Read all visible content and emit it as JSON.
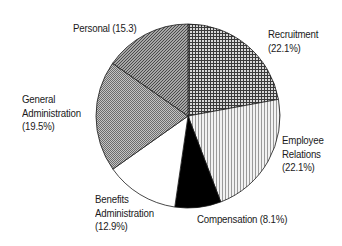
{
  "chart_data": {
    "type": "pie",
    "title": "",
    "start_angle_deg": 0,
    "direction": "clockwise",
    "legend": "none (direct labels)",
    "slices": [
      {
        "name": "Recruitment",
        "value": 22.1,
        "label_lines": [
          "Recruitment",
          "(22.1%)"
        ],
        "pattern": "crosshatch-dark"
      },
      {
        "name": "Employee Relations",
        "value": 22.1,
        "label_lines": [
          "Employee",
          "Relations",
          "(22.1%)"
        ],
        "pattern": "vertical-lines-light"
      },
      {
        "name": "Compensation",
        "value": 8.1,
        "label_lines": [
          "Compensation (8.1%)"
        ],
        "pattern": "solid-black"
      },
      {
        "name": "Benefits Administration",
        "value": 12.9,
        "label_lines": [
          "Benefits",
          "Administration",
          "(12.9%)"
        ],
        "pattern": "solid-white"
      },
      {
        "name": "General Administration",
        "value": 19.5,
        "label_lines": [
          "General",
          "Administration",
          "(19.5%)"
        ],
        "pattern": "checker-medium"
      },
      {
        "name": "Personal",
        "value": 15.3,
        "label_lines": [
          "Personal (15.3)"
        ],
        "pattern": "diagonal-dark"
      }
    ]
  },
  "labels": {
    "recruitment": {
      "l1": "Recruitment",
      "l2": "(22.1%)"
    },
    "employee_relations": {
      "l1": "Employee",
      "l2": "Relations",
      "l3": "(22.1%)"
    },
    "compensation": {
      "l1": "Compensation (8.1%)"
    },
    "benefits": {
      "l1": "Benefits",
      "l2": "Administration",
      "l3": "(12.9%)"
    },
    "general": {
      "l1": "General",
      "l2": "Administration",
      "l3": "(19.5%)"
    },
    "personal": {
      "l1": "Personal (15.3)"
    }
  }
}
